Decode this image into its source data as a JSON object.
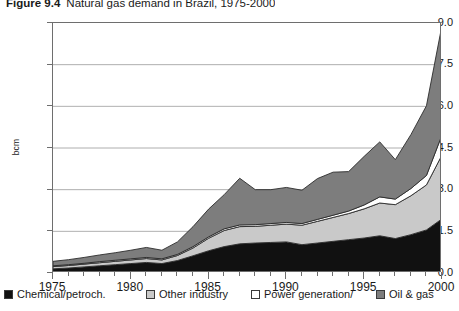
{
  "title": {
    "number": "Figure 9.4",
    "text": "Natural gas demand in Brazil, 1975-2000"
  },
  "axes": {
    "y_title": "bcm",
    "y_ticks": [
      "0.0",
      "1.5",
      "3.0",
      "4.5",
      "6.0",
      "7.5",
      "9.0"
    ],
    "x_ticks": [
      "1975",
      "1980",
      "1985",
      "1990",
      "1995",
      "2000"
    ]
  },
  "legend": {
    "items": [
      {
        "label": "Chemical/petroch.",
        "color": "#111111"
      },
      {
        "label": "Other industry",
        "color": "#c9c9c9"
      },
      {
        "label": "Power generation/",
        "color": "#ffffff"
      },
      {
        "label": "Oil & gas",
        "color": "#7d7d7d"
      }
    ]
  },
  "chart_data": {
    "type": "area",
    "stacked": true,
    "title": "Natural gas demand in Brazil, 1975-2000",
    "xlabel": "",
    "ylabel": "bcm",
    "ylim": [
      0.0,
      9.0
    ],
    "ytick_step": 1.5,
    "xlim": [
      1975,
      2000
    ],
    "grid": "horizontal",
    "legend_position": "bottom",
    "units": "bcm",
    "x": [
      1975,
      1976,
      1977,
      1978,
      1979,
      1980,
      1981,
      1982,
      1983,
      1984,
      1985,
      1986,
      1987,
      1988,
      1989,
      1990,
      1991,
      1992,
      1993,
      1994,
      1995,
      1996,
      1997,
      1998,
      1999,
      2000
    ],
    "series": [
      {
        "name": "Chemical/petroch.",
        "color": "#111111",
        "values": [
          0.15,
          0.18,
          0.22,
          0.26,
          0.3,
          0.34,
          0.38,
          0.34,
          0.45,
          0.62,
          0.8,
          0.95,
          1.05,
          1.08,
          1.1,
          1.12,
          1.02,
          1.08,
          1.14,
          1.2,
          1.26,
          1.34,
          1.24,
          1.38,
          1.55,
          1.95
        ]
      },
      {
        "name": "Other industry",
        "color": "#c9c9c9",
        "values": [
          0.08,
          0.09,
          0.1,
          0.11,
          0.12,
          0.13,
          0.14,
          0.13,
          0.18,
          0.28,
          0.45,
          0.58,
          0.62,
          0.6,
          0.62,
          0.64,
          0.7,
          0.78,
          0.86,
          0.94,
          1.05,
          1.18,
          1.22,
          1.4,
          1.62,
          2.3
        ]
      },
      {
        "name": "Power generation/",
        "color": "#ffffff",
        "values": [
          0.03,
          0.03,
          0.03,
          0.04,
          0.04,
          0.04,
          0.04,
          0.04,
          0.04,
          0.05,
          0.05,
          0.06,
          0.06,
          0.06,
          0.06,
          0.06,
          0.06,
          0.07,
          0.08,
          0.09,
          0.14,
          0.22,
          0.2,
          0.26,
          0.34,
          0.72
        ]
      },
      {
        "name": "Oil & gas",
        "color": "#7d7d7d",
        "values": [
          0.16,
          0.18,
          0.21,
          0.24,
          0.27,
          0.31,
          0.36,
          0.31,
          0.45,
          0.72,
          1.0,
          1.23,
          1.68,
          1.26,
          1.22,
          1.26,
          1.2,
          1.47,
          1.55,
          1.42,
          1.75,
          1.98,
          1.42,
          1.94,
          2.51,
          3.95
        ]
      }
    ],
    "totals": [
      0.42,
      0.48,
      0.56,
      0.65,
      0.73,
      0.82,
      0.92,
      0.82,
      1.12,
      1.67,
      2.3,
      2.82,
      3.41,
      3.0,
      3.0,
      3.08,
      2.98,
      3.4,
      3.63,
      3.65,
      4.2,
      4.72,
      4.08,
      4.98,
      6.02,
      8.92
    ]
  }
}
